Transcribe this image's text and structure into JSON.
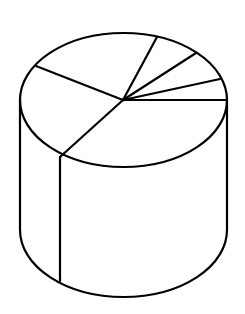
{
  "diagram": {
    "type": "3d-pie-cylinder",
    "stroke_color": "#000000",
    "background_color": "#ffffff",
    "top_ellipse": {
      "cx": 123.5,
      "cy": 100,
      "rx": 103.5,
      "ry": 67
    },
    "bottom_ellipse": {
      "cx": 123.5,
      "cy": 230,
      "rx": 103.5,
      "ry": 67
    },
    "center": {
      "x": 123,
      "y": 100
    },
    "slice_endpoints": [
      {
        "x": 36,
        "y": 66
      },
      {
        "x": 157,
        "y": 37
      },
      {
        "x": 196,
        "y": 53
      },
      {
        "x": 220,
        "y": 79
      },
      {
        "x": 227,
        "y": 100
      },
      {
        "x": 60,
        "y": 157
      }
    ],
    "side_divider": {
      "x": 60,
      "y1": 157,
      "y2": 281
    }
  }
}
